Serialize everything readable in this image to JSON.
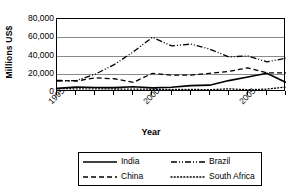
{
  "chart_data": {
    "type": "line",
    "title": "",
    "xlabel": "Year",
    "ylabel": "Millions US$",
    "xlim": [
      1995,
      2007
    ],
    "ylim": [
      0,
      80000
    ],
    "grid": true,
    "legend_position": "bottom",
    "x": [
      1995,
      1996,
      1997,
      1998,
      1999,
      2000,
      2001,
      2002,
      2003,
      2004,
      2005,
      2006,
      2007
    ],
    "ytick_labels": [
      "0",
      "20,000",
      "40,000",
      "60,000",
      "80,000"
    ],
    "ytick_values": [
      0,
      20000,
      40000,
      60000,
      80000
    ],
    "xtick_labels": [
      "1995",
      "2000",
      "2005"
    ],
    "xtick_values": [
      1995,
      2000,
      2005
    ],
    "series": [
      {
        "name": "India",
        "style": "solid",
        "values": [
          4000,
          5500,
          5000,
          4800,
          5800,
          4500,
          5200,
          7000,
          7500,
          12500,
          16500,
          20500,
          10500
        ]
      },
      {
        "name": "Brazil",
        "style": "dash-dot-dot",
        "values": [
          12000,
          12500,
          19500,
          30000,
          44000,
          60000,
          50500,
          52500,
          47000,
          38500,
          39500,
          33000,
          37000
        ]
      },
      {
        "name": "China",
        "style": "dashed",
        "values": [
          12800,
          12000,
          15500,
          14500,
          10500,
          20500,
          18500,
          18500,
          20500,
          22500,
          26500,
          21000,
          21000
        ]
      },
      {
        "name": "South Africa",
        "style": "dotted",
        "values": [
          3800,
          3500,
          3500,
          3300,
          3200,
          3000,
          2800,
          2800,
          2600,
          3500,
          2500,
          3200,
          5500
        ]
      }
    ]
  },
  "axis": {
    "y_title": "Millions US$",
    "x_title": "Year"
  },
  "legend": {
    "items": [
      {
        "label": "India",
        "style": "solid"
      },
      {
        "label": "Brazil",
        "style": "dash-dot-dot"
      },
      {
        "label": "China",
        "style": "dashed"
      },
      {
        "label": "South Africa",
        "style": "dotted"
      }
    ]
  },
  "colors": {
    "line": "#000000",
    "grid": "#8a8a8a",
    "axis": "#000000",
    "background": "#ffffff"
  }
}
